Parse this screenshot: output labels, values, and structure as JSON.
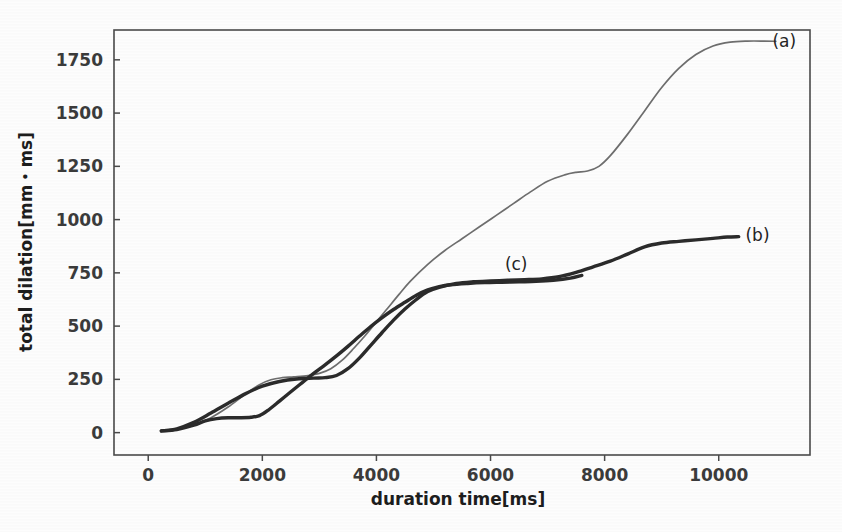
{
  "figure": {
    "background_color": "#ffffff",
    "frame_color": "#4a4a4a"
  },
  "axis": {
    "x_title": "duration time[ms]",
    "y_title": "total dilation[mm・ms]"
  },
  "chart_data": {
    "type": "line",
    "title": "",
    "subtitle": "",
    "xlabel": "duration time[ms]",
    "ylabel": "total dilation[mm・ms]",
    "xlim": [
      -600,
      11600
    ],
    "ylim": [
      -105,
      1890
    ],
    "xticks": [
      0,
      2000,
      4000,
      6000,
      8000,
      10000
    ],
    "xticklabels": [
      "0",
      "2000",
      "4000",
      "6000",
      "8000",
      "10000"
    ],
    "yticks": [
      0,
      250,
      500,
      750,
      1000,
      1250,
      1500,
      1750
    ],
    "yticklabels": [
      "0",
      "250",
      "500",
      "750",
      "1000",
      "1250",
      "1500",
      "1750"
    ],
    "grid": false,
    "legend": "inline-endpoint-labels",
    "annotations": [
      {
        "text": "(a)",
        "x": 11150,
        "y": 1840,
        "series": "a"
      },
      {
        "text": "(b)",
        "x": 10680,
        "y": 930,
        "series": "b"
      },
      {
        "text": "(c)",
        "x": 6450,
        "y": 790,
        "series": "c"
      }
    ],
    "series": [
      {
        "name": "(a)",
        "color": "#6e6e6e",
        "linewidth": 1.7,
        "x": [
          230,
          500,
          800,
          1100,
          1400,
          1700,
          1950,
          2150,
          2350,
          2550,
          2800,
          3000,
          3200,
          3400,
          3600,
          3800,
          4000,
          4200,
          4400,
          4600,
          4900,
          5200,
          5500,
          5800,
          6100,
          6400,
          6700,
          7000,
          7300,
          7500,
          7700,
          7900,
          8100,
          8400,
          8700,
          9000,
          9300,
          9600,
          9900,
          10200,
          10500,
          10800,
          11000
        ],
        "y": [
          8,
          15,
          35,
          70,
          120,
          180,
          225,
          248,
          258,
          262,
          268,
          278,
          300,
          340,
          395,
          455,
          520,
          585,
          650,
          712,
          790,
          855,
          910,
          965,
          1020,
          1075,
          1130,
          1180,
          1210,
          1222,
          1228,
          1250,
          1300,
          1400,
          1510,
          1620,
          1710,
          1775,
          1815,
          1833,
          1838,
          1838,
          1837
        ]
      },
      {
        "name": "(b)",
        "color": "#2b2b2b",
        "linewidth": 3.4,
        "x": [
          230,
          500,
          800,
          1100,
          1400,
          1700,
          2000,
          2300,
          2600,
          2900,
          3100,
          3300,
          3500,
          3700,
          3900,
          4100,
          4300,
          4500,
          4700,
          4900,
          5100,
          5400,
          5700,
          6000,
          6300,
          6600,
          6900,
          7200,
          7500,
          7800,
          8100,
          8400,
          8700,
          9000,
          9300,
          9600,
          9900,
          10150,
          10350
        ],
        "y": [
          8,
          18,
          48,
          92,
          138,
          182,
          218,
          240,
          252,
          256,
          258,
          268,
          300,
          350,
          410,
          470,
          528,
          580,
          625,
          662,
          682,
          700,
          708,
          712,
          715,
          718,
          722,
          732,
          752,
          778,
          805,
          838,
          872,
          890,
          898,
          905,
          912,
          918,
          920
        ]
      },
      {
        "name": "(c)",
        "color": "#2b2b2b",
        "linewidth": 3.4,
        "x": [
          230,
          500,
          800,
          1000,
          1200,
          1400,
          1600,
          1800,
          1950,
          2100,
          2300,
          2500,
          2700,
          2900,
          3100,
          3300,
          3500,
          3700,
          3900,
          4100,
          4300,
          4500,
          4700,
          4900,
          5100,
          5300,
          5600,
          5900,
          6200,
          6500,
          6800,
          7100,
          7400,
          7600
        ],
        "y": [
          8,
          14,
          35,
          55,
          66,
          70,
          70,
          72,
          80,
          105,
          148,
          192,
          235,
          278,
          318,
          360,
          405,
          452,
          498,
          540,
          578,
          612,
          645,
          670,
          685,
          694,
          700,
          704,
          706,
          708,
          710,
          715,
          725,
          738
        ]
      }
    ]
  }
}
